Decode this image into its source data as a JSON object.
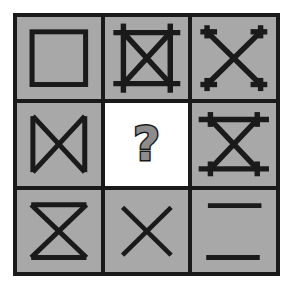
{
  "puzzle": {
    "type": "visual-analogy-matrix",
    "title": "3x3 figure matrix with missing element",
    "grid": {
      "rows": 3,
      "columns": 3,
      "cell_fill_color": "#a8a8a8",
      "missing_cell_fill_color": "#ffffff",
      "line_color": "#1a1a1a",
      "background_color": "#ffffff",
      "border_width_px": 4,
      "gap_px": 4
    },
    "cells": [
      {
        "index": 1,
        "row": 1,
        "column": 1,
        "name": "square-outline",
        "description": "Plain square outline, no diagonals",
        "features": {
          "square": true,
          "diagonals": false,
          "overhang": false
        },
        "is_missing": false
      },
      {
        "index": 2,
        "row": 1,
        "column": 2,
        "name": "square-with-x-and-overhang",
        "description": "Square with overhanging edges forming crosses at corners, plus an X of both diagonals",
        "features": {
          "square": true,
          "diagonals": true,
          "overhang": true
        },
        "is_missing": false
      },
      {
        "index": 3,
        "row": 1,
        "column": 3,
        "name": "x-with-corner-serifs",
        "description": "X with short perpendicular corner stubs at each of the four endpoints",
        "features": {
          "square": false,
          "diagonals": true,
          "overhang": true
        },
        "is_missing": false
      },
      {
        "index": 4,
        "row": 2,
        "column": 1,
        "name": "bowtie-vertical-sides",
        "description": "X with vertical lines on the left and right sides (bowtie)",
        "features": {
          "square": "sides-only",
          "diagonals": true,
          "overhang": false
        },
        "is_missing": false
      },
      {
        "index": 5,
        "row": 2,
        "column": 2,
        "name": "missing-element",
        "description": "White cell containing a bold question mark indicating the missing figure",
        "symbol": "?",
        "features": {
          "square": false,
          "diagonals": false,
          "overhang": false
        },
        "is_missing": true
      },
      {
        "index": 6,
        "row": 2,
        "column": 3,
        "name": "hourglass-with-overhang",
        "description": "X with top and bottom horizontal bars that overhang, plus short vertical stubs at the corners",
        "features": {
          "square": "top-bottom-only",
          "diagonals": true,
          "overhang": true
        },
        "is_missing": false
      },
      {
        "index": 7,
        "row": 3,
        "column": 1,
        "name": "hourglass",
        "description": "X with horizontal top and bottom lines (hourglass)",
        "features": {
          "square": "top-bottom-only",
          "diagonals": true,
          "overhang": false
        },
        "is_missing": false
      },
      {
        "index": 8,
        "row": 3,
        "column": 2,
        "name": "x-only",
        "description": "Plain X of two diagonals, no edges",
        "features": {
          "square": false,
          "diagonals": true,
          "overhang": false
        },
        "is_missing": false
      },
      {
        "index": 9,
        "row": 3,
        "column": 3,
        "name": "two-horizontal-lines",
        "description": "Two horizontal lines, top and bottom, no diagonals",
        "features": {
          "square": "top-bottom-only",
          "diagonals": false,
          "overhang": false
        },
        "is_missing": false
      }
    ]
  }
}
